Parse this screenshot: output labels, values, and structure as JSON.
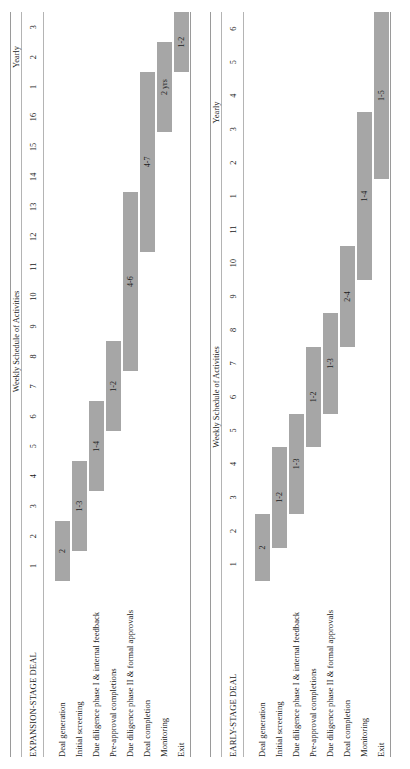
{
  "figure": {
    "bar_color": "#a6a6a6",
    "rule_color": "#9a9a9a",
    "background": "#ffffff"
  },
  "chart_data": {
    "type": "bar",
    "title": "Weekly Schedule of Activities",
    "xlabel": "",
    "ylabel": "",
    "grid": false,
    "legend": "none",
    "orientation": "horizontal-gantt",
    "panels": [
      {
        "name": "EXPANSION-STAGE DEAL",
        "group_headers": [
          {
            "label": "Weekly Schedule of Activities",
            "span": 16
          },
          {
            "label": "Yearly",
            "span": 3
          }
        ],
        "ticks": [
          "1",
          "2",
          "3",
          "4",
          "5",
          "6",
          "7",
          "8",
          "9",
          "10",
          "11",
          "12",
          "13",
          "14",
          "15",
          "16",
          "1",
          "2",
          "3"
        ],
        "weekly_count": 16,
        "yearly_count": 3,
        "rows": [
          {
            "label": "Deal generation",
            "start": 1,
            "end": 2,
            "value": "2"
          },
          {
            "label": "Initial screening",
            "start": 2,
            "end": 4,
            "value": "1-3"
          },
          {
            "label": "Due diligence phase I & internal feedback",
            "start": 4,
            "end": 6,
            "value": "1-4"
          },
          {
            "label": "Pre-approval completions",
            "start": 6,
            "end": 8,
            "value": "1-2"
          },
          {
            "label": "Due diligence phase II & formal approvals",
            "start": 8,
            "end": 13,
            "value": "4-6"
          },
          {
            "label": "Deal completion",
            "start": 12,
            "end": 17,
            "value": "4-7"
          },
          {
            "label": "Monitoring",
            "start": 16,
            "end": 18,
            "value": "2 yrs"
          },
          {
            "label": "Exit",
            "start": 18,
            "end": 20,
            "value": "1-2"
          }
        ]
      },
      {
        "name": "EARLY-STAGE DEAL",
        "group_headers": [
          {
            "label": "Weekly Schedule of Activities",
            "span": 11
          },
          {
            "label": "Yearly",
            "span": 6
          }
        ],
        "ticks": [
          "1",
          "2",
          "3",
          "4",
          "5",
          "6",
          "7",
          "8",
          "9",
          "10",
          "11",
          "1",
          "2",
          "3",
          "4",
          "5",
          "6"
        ],
        "weekly_count": 11,
        "yearly_count": 6,
        "rows": [
          {
            "label": "Deal generation",
            "start": 1,
            "end": 2,
            "value": "2"
          },
          {
            "label": "Initial screening",
            "start": 2,
            "end": 4,
            "value": "1-2"
          },
          {
            "label": "Due diligence phase I & internal feedback",
            "start": 3,
            "end": 5,
            "value": "1-3"
          },
          {
            "label": "Pre-approval completions",
            "start": 5,
            "end": 7,
            "value": "1-2"
          },
          {
            "label": "Due diligence phase II & formal approvals",
            "start": 6,
            "end": 8,
            "value": "1-3"
          },
          {
            "label": "Deal completion",
            "start": 8,
            "end": 10,
            "value": "2-4"
          },
          {
            "label": "Monitoring",
            "start": 10,
            "end": 14,
            "value": "1-4"
          },
          {
            "label": "Exit",
            "start": 13,
            "end": 18,
            "value": "1-5"
          }
        ]
      }
    ]
  }
}
